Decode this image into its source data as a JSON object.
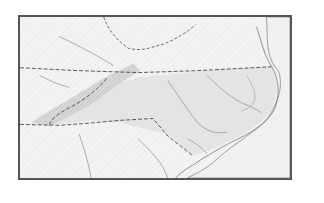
{
  "map": {
    "region": "North Carolina",
    "style": "grayscale shaded relief base map",
    "labels": [],
    "colors": {
      "background": "#ffffff",
      "frame": "#555555",
      "land_outside": "#f3f3f3",
      "highlighted_state": "#e4e4e4",
      "mountains": "#c9c9c9",
      "ocean": "#f0f0f0",
      "state_boundary": "#444444",
      "rivers": "#8a8a8a",
      "coastline": "#777777"
    },
    "features": [
      {
        "name": "Virginia",
        "type": "state",
        "position": "north"
      },
      {
        "name": "North Carolina",
        "type": "state",
        "highlighted": true
      },
      {
        "name": "South Carolina",
        "type": "state",
        "position": "south"
      },
      {
        "name": "Tennessee",
        "type": "state",
        "position": "west"
      },
      {
        "name": "Atlantic Ocean",
        "type": "water",
        "position": "east"
      }
    ]
  }
}
